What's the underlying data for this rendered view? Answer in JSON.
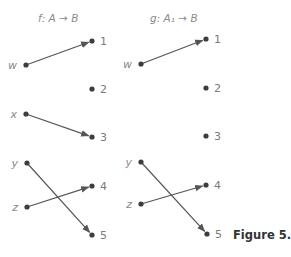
{
  "figure": {
    "caption": "Figure 5.5",
    "panels": [
      {
        "id": "f",
        "title": "f: A → B",
        "domain": [
          {
            "label": "w",
            "x": 26,
            "y": 65
          },
          {
            "label": "x",
            "x": 26,
            "y": 114
          },
          {
            "label": "y",
            "x": 27,
            "y": 163
          },
          {
            "label": "z",
            "x": 27,
            "y": 207
          }
        ],
        "codomain": [
          {
            "label": "1",
            "x": 92,
            "y": 41
          },
          {
            "label": "2",
            "x": 92,
            "y": 89
          },
          {
            "label": "3",
            "x": 92,
            "y": 137
          },
          {
            "label": "4",
            "x": 92,
            "y": 186
          },
          {
            "label": "5",
            "x": 92,
            "y": 235
          }
        ],
        "mappings": [
          {
            "from": "w",
            "to": "1"
          },
          {
            "from": "x",
            "to": "3"
          },
          {
            "from": "y",
            "to": "5"
          },
          {
            "from": "z",
            "to": "4"
          }
        ]
      },
      {
        "id": "g",
        "title": "g: A₁ → B",
        "domain": [
          {
            "label": "w",
            "x": 141,
            "y": 64
          },
          {
            "label": "y",
            "x": 141,
            "y": 162
          },
          {
            "label": "z",
            "x": 141,
            "y": 204
          }
        ],
        "codomain": [
          {
            "label": "1",
            "x": 206,
            "y": 39
          },
          {
            "label": "2",
            "x": 206,
            "y": 88
          },
          {
            "label": "3",
            "x": 206,
            "y": 136
          },
          {
            "label": "4",
            "x": 206,
            "y": 185
          },
          {
            "label": "5",
            "x": 207,
            "y": 234
          }
        ],
        "mappings": [
          {
            "from": "w",
            "to": "1"
          },
          {
            "from": "y",
            "to": "5"
          },
          {
            "from": "z",
            "to": "4"
          }
        ]
      }
    ]
  }
}
